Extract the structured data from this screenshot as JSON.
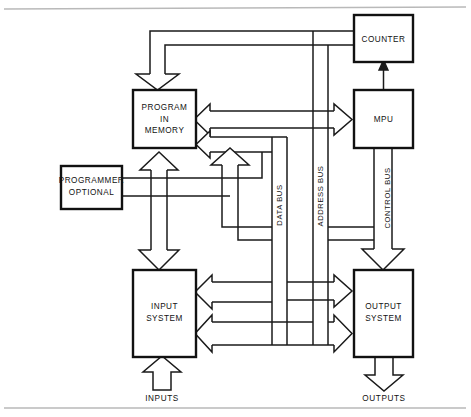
{
  "diagram": {
    "colors": {
      "line": "#1a1a1a",
      "box_border": "#111111",
      "box_fill": "#ffffff",
      "background": "#ffffff",
      "rule": "#b9b9b9"
    },
    "blocks": [
      {
        "id": "counter",
        "label_line1": "COUNTER",
        "label_line2": ""
      },
      {
        "id": "mpu",
        "label_line1": "MPU",
        "label_line2": ""
      },
      {
        "id": "program",
        "label_line1": "PROGRAM",
        "label_line2": "IN",
        "label_line3": "MEMORY"
      },
      {
        "id": "programmer",
        "label_line1": "PROGRAMMER",
        "label_line2": "OPTIONAL"
      },
      {
        "id": "input",
        "label_line1": "INPUT",
        "label_line2": "SYSTEM"
      },
      {
        "id": "output",
        "label_line1": "OUTPUT",
        "label_line2": "SYSTEM"
      }
    ],
    "buses": [
      {
        "id": "data",
        "label": "DATA BUS"
      },
      {
        "id": "address",
        "label": "ADDRESS BUS"
      },
      {
        "id": "control",
        "label": "CONTROL BUS"
      }
    ],
    "io_labels": [
      {
        "id": "inputs",
        "label": "INPUTS"
      },
      {
        "id": "outputs",
        "label": "OUTPUTS"
      }
    ]
  }
}
